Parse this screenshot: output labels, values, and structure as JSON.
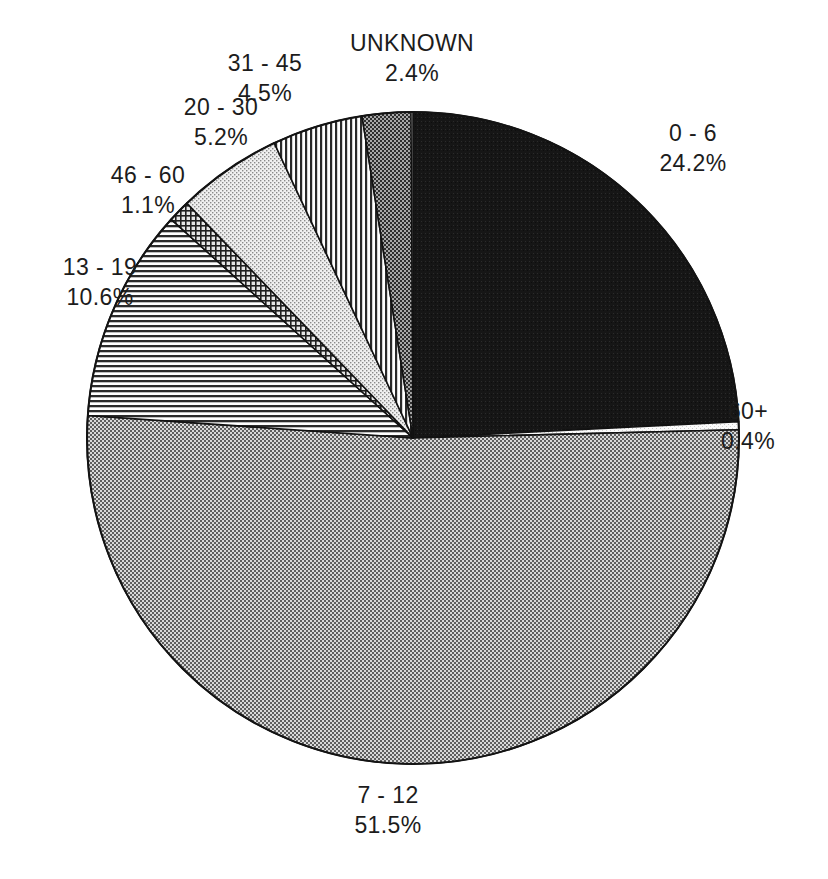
{
  "chart_data": {
    "type": "pie",
    "title": "",
    "subtitle": "",
    "xlabel": "",
    "ylabel": "",
    "legend_position": "none",
    "labels_position": "outside",
    "grid": false,
    "start_angle_deg": 0,
    "direction": "clockwise",
    "categories": [
      "0 - 6",
      "60+",
      "7 - 12",
      "13 - 19",
      "46 - 60",
      "20 - 30",
      "31 - 45",
      "UNKNOWN"
    ],
    "values": [
      24.2,
      0.4,
      51.5,
      10.6,
      1.1,
      5.2,
      4.5,
      2.4
    ],
    "unit": "%",
    "slices": [
      {
        "name": "0 - 6",
        "percent": 24.2,
        "percent_label": "24.2%",
        "fill": "solid-black",
        "color": "#1a1a1a",
        "label_name": "0 - 6",
        "start_deg": 0.0,
        "end_deg": 87.12
      },
      {
        "name": "60+",
        "percent": 0.4,
        "percent_label": "0.4%",
        "fill": "very-light-stipple",
        "color": "#f2f2f2",
        "label_name": "60+",
        "start_deg": 87.12,
        "end_deg": 88.56
      },
      {
        "name": "7 - 12",
        "percent": 51.5,
        "percent_label": "51.5%",
        "fill": "medium-checker",
        "color": "#8c8c8c",
        "label_name": "7 - 12",
        "start_deg": 88.56,
        "end_deg": 273.96
      },
      {
        "name": "13 - 19",
        "percent": 10.6,
        "percent_label": "10.6%",
        "fill": "horizontal-lines",
        "color": "#b5b5b5",
        "label_name": "13 - 19",
        "start_deg": 273.96,
        "end_deg": 312.12
      },
      {
        "name": "46 - 60",
        "percent": 1.1,
        "percent_label": "1.1%",
        "fill": "cross-hatch",
        "color": "#6e6e6e",
        "label_name": "46 - 60",
        "start_deg": 312.12,
        "end_deg": 316.08
      },
      {
        "name": "20 - 30",
        "percent": 5.2,
        "percent_label": "5.2%",
        "fill": "light-stipple",
        "color": "#dcdcdc",
        "label_name": "20 - 30",
        "start_deg": 316.08,
        "end_deg": 334.8
      },
      {
        "name": "31 - 45",
        "percent": 4.5,
        "percent_label": "4.5%",
        "fill": "vertical-lines",
        "color": "#c6c6c6",
        "label_name": "31 - 45",
        "start_deg": 334.8,
        "end_deg": 351.0
      },
      {
        "name": "UNKNOWN",
        "percent": 2.4,
        "percent_label": "2.4%",
        "fill": "dark-checker",
        "color": "#6a6a6a",
        "label_name": "UNKNOWN",
        "start_deg": 351.0,
        "end_deg": 360.0
      }
    ]
  },
  "labels": {
    "unknown": {
      "name": "UNKNOWN",
      "pct": "2.4%"
    },
    "age31_45": {
      "name": "31 - 45",
      "pct": "4.5%"
    },
    "age20_30": {
      "name": "20 - 30",
      "pct": "5.2%"
    },
    "age46_60": {
      "name": "46 - 60",
      "pct": "1.1%"
    },
    "age13_19": {
      "name": "13 - 19",
      "pct": "10.6%"
    },
    "age0_6": {
      "name": "0 - 6",
      "pct": "24.2%"
    },
    "age60plus": {
      "name": "60+",
      "pct": "0.4%"
    },
    "age7_12": {
      "name": "7 - 12",
      "pct": "51.5%"
    }
  },
  "geometry": {
    "center_x": 413,
    "center_y": 438,
    "radius": 326
  }
}
